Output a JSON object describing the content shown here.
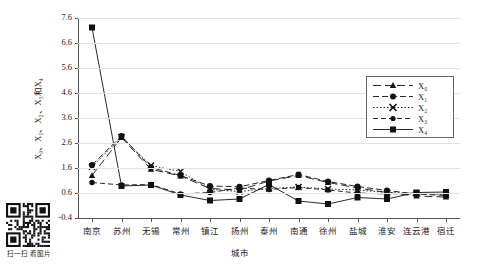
{
  "chart_data": {
    "type": "line",
    "title": "",
    "xlabel": "城市",
    "ylabel": "X₀、X₁、X₂、X₃和X₄",
    "ylabel_plain": "X0, X1, X2, X3和X4",
    "categories": [
      "南京",
      "苏州",
      "无锡",
      "常州",
      "镇江",
      "扬州",
      "泰州",
      "南通",
      "徐州",
      "盐城",
      "淮安",
      "连云港",
      "宿迁"
    ],
    "ylim": [
      -0.4,
      7.6
    ],
    "yticks": [
      -0.4,
      0.6,
      1.6,
      2.6,
      3.6,
      4.6,
      5.6,
      6.6,
      7.6
    ],
    "ytick_labels": [
      "-0.4",
      "0.6",
      "1.6",
      "2.6",
      "3.6",
      "4.6",
      "5.6",
      "6.6",
      "7.6"
    ],
    "grid": true,
    "legend_position": "upper right",
    "series": [
      {
        "name": "X0",
        "label": "X₀",
        "marker": "triangle",
        "dash": "8 4",
        "values": [
          1.3,
          2.82,
          1.55,
          1.28,
          0.78,
          0.72,
          1.08,
          1.3,
          1.02,
          0.8,
          0.62,
          0.48,
          0.44
        ]
      },
      {
        "name": "X1",
        "label": "X₁",
        "marker": "circle",
        "dash": "6 3",
        "values": [
          1.72,
          2.88,
          1.62,
          1.3,
          0.88,
          0.85,
          1.1,
          1.34,
          1.06,
          0.86,
          0.7,
          0.56,
          0.5
        ]
      },
      {
        "name": "X2",
        "label": "X₂",
        "marker": "cross",
        "dash": "1.5 2",
        "values": [
          1.65,
          2.84,
          1.7,
          1.46,
          0.74,
          0.66,
          0.78,
          0.84,
          0.76,
          0.72,
          0.62,
          0.58,
          0.54
        ]
      },
      {
        "name": "X3",
        "label": "X₃",
        "marker": "circle-small",
        "dash": "5 3",
        "values": [
          1.02,
          0.92,
          0.94,
          0.56,
          0.62,
          0.8,
          0.74,
          0.82,
          0.72,
          0.6,
          0.56,
          0.6,
          0.56
        ]
      },
      {
        "name": "X4",
        "label": "X₄",
        "marker": "square",
        "dash": "none",
        "values": [
          7.22,
          0.88,
          0.92,
          0.52,
          0.3,
          0.36,
          0.94,
          0.28,
          0.16,
          0.42,
          0.36,
          0.62,
          0.64
        ]
      }
    ]
  },
  "legend": {
    "entries": [
      {
        "label": "X₀"
      },
      {
        "label": "X₁"
      },
      {
        "label": "X₂"
      },
      {
        "label": "X₃"
      },
      {
        "label": "X₄"
      }
    ]
  },
  "qr": {
    "caption": "扫一扫 看图片"
  }
}
